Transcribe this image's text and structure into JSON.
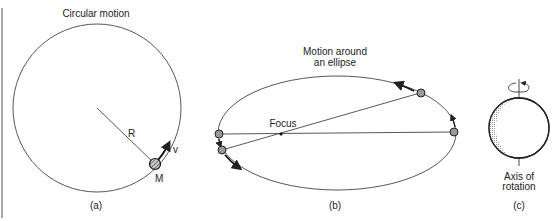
{
  "panels": {
    "a": {
      "title": "Circular motion",
      "radius_label": "R",
      "mass_label": "M",
      "velocity_label": "v",
      "caption": "(a)"
    },
    "b": {
      "title_line1": "Motion around",
      "title_line2": "an ellipse",
      "focus_label": "Focus",
      "caption": "(b)"
    },
    "c": {
      "axis_label_line1": "Axis of",
      "axis_label_line2": "rotation",
      "caption": "(c)"
    }
  },
  "colors": {
    "line": "#333333",
    "ball_fill": "#9a9a9a",
    "shade": "#bdbdbd",
    "background": "#ffffff"
  }
}
